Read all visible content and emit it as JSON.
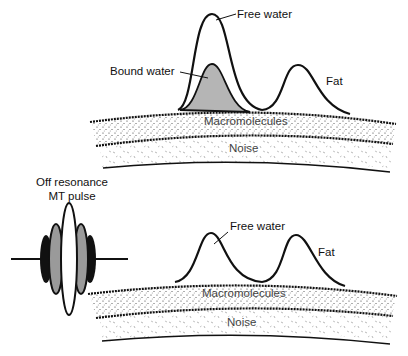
{
  "top_panel": {
    "labels": {
      "free_water": "Free water",
      "bound_water": "Bound water",
      "fat": "Fat",
      "macromolecules": "Macromolecules",
      "noise": "Noise"
    }
  },
  "bottom_panel": {
    "pulse_label_line1": "Off resonance",
    "pulse_label_line2": "MT pulse",
    "labels": {
      "free_water": "Free water",
      "fat": "Fat",
      "macromolecules": "Macromolecules",
      "noise": "Noise"
    }
  },
  "colors": {
    "line": "#111111",
    "bound_water_fill": "#b5b5b5",
    "pulse_dark": "#111111",
    "pulse_gray": "#9a9a9a"
  }
}
